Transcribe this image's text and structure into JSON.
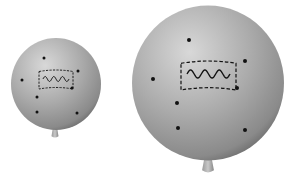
{
  "scene": {
    "description": "Two gray balloons illustrating expansion: a small balloon and a larger inflated balloon, each marked with dots and a dashed rectangle containing a wavy line",
    "background": "#ffffff",
    "balloon_color_light": "#d4d4d4",
    "balloon_color_mid": "#a9a9a9",
    "balloon_color_dark": "#7c7c7c",
    "mark_color": "#111111"
  },
  "balloons": [
    {
      "name": "small",
      "cx": 56,
      "cy": 84,
      "r": 45,
      "knot": {
        "x": 55,
        "y": 133
      },
      "dots": [
        [
          44,
          58
        ],
        [
          78,
          71
        ],
        [
          22,
          80
        ],
        [
          37,
          97
        ],
        [
          37,
          112
        ],
        [
          77,
          113
        ],
        [
          72,
          88
        ]
      ],
      "rect": {
        "x": 39,
        "y": 70,
        "w": 34,
        "h": 19
      },
      "wave": {
        "x": 43,
        "y": 79,
        "w": 26,
        "amp": 2.5,
        "cycles": 3
      }
    },
    {
      "name": "large",
      "cx": 208,
      "cy": 83,
      "r": 76,
      "knot": {
        "x": 208,
        "y": 165
      },
      "dots": [
        [
          189,
          40
        ],
        [
          245,
          61
        ],
        [
          153,
          79
        ],
        [
          177,
          103
        ],
        [
          178,
          128
        ],
        [
          245,
          130
        ],
        [
          237,
          88
        ]
      ],
      "rect": {
        "x": 181,
        "y": 61,
        "w": 55,
        "h": 29
      },
      "wave": {
        "x": 187,
        "y": 74,
        "w": 43,
        "amp": 4,
        "cycles": 3
      }
    }
  ]
}
